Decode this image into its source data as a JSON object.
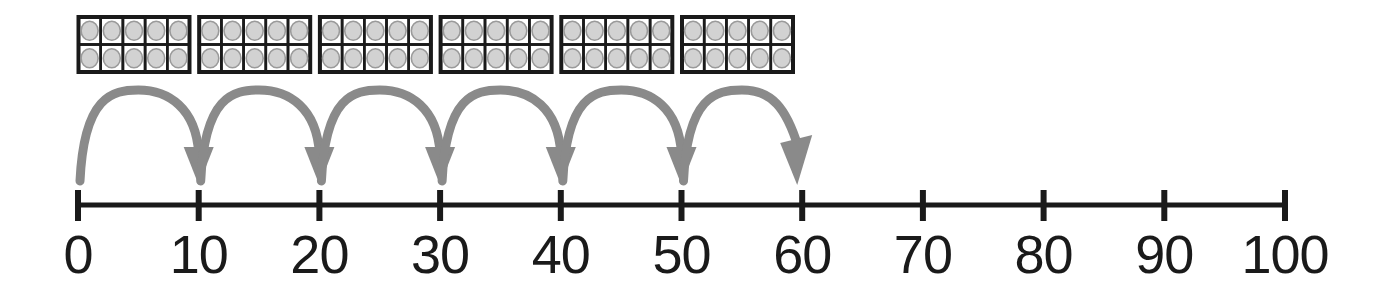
{
  "figure": {
    "colors": {
      "line": "#1a1a1a",
      "tick": "#1a1a1a",
      "label": "#1a1a1a",
      "arc": "#8a8a8a",
      "frame_border": "#1a1a1a",
      "counter_fill": "#d2d2d2",
      "counter_ring": "#9a9a9a",
      "cell_fill": "#ffffff",
      "background": "#ffffff"
    }
  },
  "number_line": {
    "min": 0,
    "max": 100,
    "step": 10,
    "tick_labels": [
      "0",
      "10",
      "20",
      "30",
      "40",
      "50",
      "60",
      "70",
      "80",
      "90",
      "100"
    ],
    "tick_values": [
      0,
      10,
      20,
      30,
      40,
      50,
      60,
      70,
      80,
      90,
      100
    ]
  },
  "jumps": {
    "count": 6,
    "size": 10,
    "start": 0,
    "end": 60,
    "arcs": [
      {
        "from": 0,
        "to": 10,
        "label": "jump-0-to-10"
      },
      {
        "from": 10,
        "to": 20,
        "label": "jump-10-to-20"
      },
      {
        "from": 20,
        "to": 30,
        "label": "jump-20-to-30"
      },
      {
        "from": 30,
        "to": 40,
        "label": "jump-30-to-40"
      },
      {
        "from": 40,
        "to": 50,
        "label": "jump-40-to-50"
      },
      {
        "from": 50,
        "to": 60,
        "label": "jump-50-to-60"
      }
    ]
  },
  "ten_frames": {
    "count": 6,
    "rows": 2,
    "columns": 5,
    "counters_per_frame": 10,
    "total_counters": 60,
    "frames": [
      {
        "index": 1,
        "filled": 10
      },
      {
        "index": 2,
        "filled": 10
      },
      {
        "index": 3,
        "filled": 10
      },
      {
        "index": 4,
        "filled": 10
      },
      {
        "index": 5,
        "filled": 10
      },
      {
        "index": 6,
        "filled": 10
      }
    ]
  }
}
